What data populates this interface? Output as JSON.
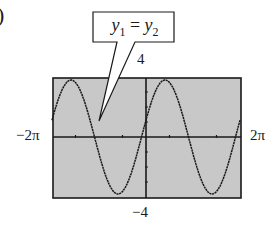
{
  "label_prefix": ")",
  "annotation": {
    "text": "y1 = y2",
    "lhs": "y",
    "lhs_sub": "1",
    "eq": " = ",
    "rhs": "y",
    "rhs_sub": "2"
  },
  "window": {
    "xmin_label": "−2π",
    "xmax_label": "2π",
    "ymax_label": "4",
    "ymin_label": "−4"
  },
  "colors": {
    "screen_bg": "#c8c8c8",
    "curve": "#1a1a1a",
    "frame": "#1a1a1a"
  },
  "chart_data": {
    "type": "line",
    "title": "",
    "annotation": "y1 = y2",
    "xlim": [
      -6.2832,
      6.2832
    ],
    "ylim": [
      -4,
      4
    ],
    "x_ticks_step": "π/2",
    "grid": false,
    "series": [
      {
        "name": "y1",
        "function_approx": "≈ 4 sin(x + 0.3)"
      },
      {
        "name": "y2",
        "function_approx": "≈ 4 sin(x + 0.3) (coincides with y1)"
      }
    ],
    "xlabel_min": "−2π",
    "xlabel_max": "2π",
    "ylabel_max": "4",
    "ylabel_min": "−4"
  }
}
